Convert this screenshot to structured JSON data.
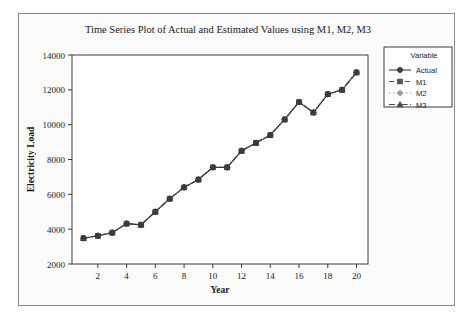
{
  "chart_data": {
    "type": "line",
    "title": "Time Series Plot of Actual and Estimated Values using  M1, M2, M3",
    "xlabel": "Year",
    "ylabel": "Electricity Load",
    "xlim": [
      0.2,
      20.8
    ],
    "ylim": [
      2000,
      14000
    ],
    "xticks": [
      2,
      4,
      6,
      8,
      10,
      12,
      14,
      16,
      18,
      20
    ],
    "yticks": [
      2000,
      4000,
      6000,
      8000,
      10000,
      12000,
      14000
    ],
    "grid": false,
    "legend_position": "right",
    "legend_title": "Variable",
    "x": [
      1,
      2,
      3,
      4,
      5,
      6,
      7,
      8,
      9,
      10,
      11,
      12,
      13,
      14,
      15,
      16,
      17,
      18,
      19,
      20
    ],
    "series": [
      {
        "name": "Actual",
        "marker": "circle",
        "line_style": "solid",
        "color": "#3b3b3b",
        "values": [
          3480,
          3620,
          3800,
          4320,
          4250,
          5000,
          5750,
          6400,
          6850,
          7550,
          7550,
          8500,
          8950,
          9400,
          10300,
          11300,
          10700,
          11750,
          12000,
          13000
        ]
      },
      {
        "name": "M1",
        "marker": "square",
        "line_style": "dashed",
        "color": "#555555",
        "values": [
          3480,
          3620,
          3800,
          4320,
          4250,
          5000,
          5750,
          6400,
          6850,
          7550,
          7550,
          8500,
          8950,
          9400,
          10300,
          11300,
          10700,
          11750,
          12000,
          13000
        ]
      },
      {
        "name": "M2",
        "marker": "diamond",
        "line_style": "dotted",
        "color": "#9a9a9a",
        "values": [
          3480,
          3620,
          3800,
          4320,
          4250,
          5000,
          5750,
          6400,
          6850,
          7550,
          7550,
          8500,
          8950,
          9400,
          10300,
          11300,
          10700,
          11750,
          12000,
          13000
        ]
      },
      {
        "name": "M3",
        "marker": "triangle",
        "line_style": "dashdot",
        "color": "#4a4a4a",
        "values": [
          3480,
          3620,
          3800,
          4320,
          4250,
          5000,
          5750,
          6400,
          6850,
          7550,
          7550,
          8500,
          8950,
          9400,
          10300,
          11300,
          10700,
          11750,
          12000,
          13000
        ]
      }
    ]
  },
  "legend": {
    "title": "Variable",
    "entries": [
      {
        "label": "Actual",
        "marker": "circle",
        "line_style": "solid"
      },
      {
        "label": "M1",
        "marker": "square",
        "line_style": "dashed"
      },
      {
        "label": "M2",
        "marker": "diamond",
        "line_style": "dotted"
      },
      {
        "label": "M3",
        "marker": "triangle",
        "line_style": "dashdot"
      }
    ]
  },
  "colors": {
    "page_background": "#fdfdfd",
    "frame_border": "#8a8a8a",
    "axis": "#3a3a3a",
    "text": "#1a1a1a",
    "series_actual": "#3b3b3b",
    "series_m1": "#555555",
    "series_m2": "#9a9a9a",
    "series_m3": "#4a4a4a"
  }
}
